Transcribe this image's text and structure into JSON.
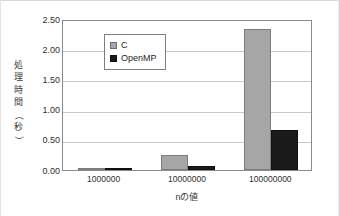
{
  "chart_data": {
    "type": "bar",
    "title": "",
    "xlabel": "nの値",
    "ylabel": "処理時間（秒）",
    "ylabel_chars": [
      "処",
      "理",
      "時",
      "間",
      "（",
      "秒",
      "）"
    ],
    "categories": [
      "1000000",
      "10000000",
      "100000000"
    ],
    "series": [
      {
        "name": "C",
        "values": [
          0.02,
          0.25,
          2.33
        ],
        "color": "#a6a6a6"
      },
      {
        "name": "OpenMP",
        "values": [
          0.01,
          0.07,
          0.67
        ],
        "color": "#1a1a1a"
      }
    ],
    "ylim": [
      0.0,
      2.5
    ],
    "ytick_step": 0.5,
    "ytick_labels": [
      "0.00",
      "0.50",
      "1.00",
      "1.50",
      "2.00",
      "2.50"
    ],
    "grid": true,
    "legend_position": "upper-left-inside",
    "plot_border_color": "#8a8a8a",
    "grid_color": "#c9c9c9",
    "background": "#ffffff"
  },
  "legend": {
    "items": [
      {
        "label": "C",
        "swatch": "legend-swatch-c"
      },
      {
        "label": "OpenMP",
        "swatch": "legend-swatch-openmp"
      }
    ]
  }
}
